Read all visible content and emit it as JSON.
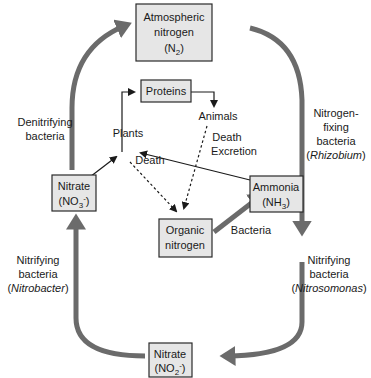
{
  "diagram": {
    "nodes": {
      "atmospheric": {
        "line1": "Atmospheric",
        "line2": "nitrogen",
        "formula_base": "(N",
        "formula_sub": "2",
        "formula_end": ")"
      },
      "proteins": {
        "label": "Proteins"
      },
      "animals": {
        "label": "Animals"
      },
      "plants": {
        "label": "Plants"
      },
      "nitrate_no3": {
        "line1": "Nitrate",
        "formula_base": "(NO",
        "formula_sub": "3",
        "formula_sup": "-",
        "formula_end": ")"
      },
      "ammonia": {
        "line1": "Ammonia",
        "formula_base": "(NH",
        "formula_sub": "3",
        "formula_end": ")"
      },
      "organic": {
        "line1": "Organic",
        "line2": "nitrogen"
      },
      "nitrate_no2": {
        "line1": "Nitrate",
        "formula_base": "(NO",
        "formula_sub": "2",
        "formula_sup": "-",
        "formula_end": ")"
      }
    },
    "labels": {
      "denitrifying": {
        "line1": "Denitrifying",
        "line2": "bacteria"
      },
      "nitrogen_fixing": {
        "line1": "Nitrogen-",
        "line2": "fixing",
        "line3": "bacteria",
        "italic": "Rhizobium"
      },
      "plant_death": "Death",
      "animal_death": "Death",
      "animal_excretion": "Excretion",
      "bacteria": "Bacteria",
      "nitrifying_left": {
        "line1": "Nitrifying",
        "line2": "bacteria",
        "italic": "Nitrobacter"
      },
      "nitrifying_right": {
        "line1": "Nitrifying",
        "line2": "bacteria",
        "italic": "Nitrosomonas"
      }
    },
    "colors": {
      "cycle_arrow": "#6b6b6b",
      "box_fill": "#e6e6e6",
      "box_stroke": "#2a2a2a"
    }
  }
}
